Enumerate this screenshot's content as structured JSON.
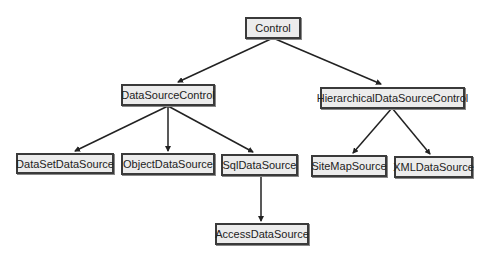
{
  "diagram": {
    "type": "class-hierarchy",
    "nodes": {
      "control": "Control",
      "datasourcecontrol": "DataSourceControl",
      "hierarchical": "HierarchicalDataSourceControl",
      "datasetdatasource": "DataSetDataSource",
      "objectdatasource": "ObjectDataSource",
      "sqldatasource": "SqlDataSource",
      "sitemapsource": "SiteMapSource",
      "xmldatasource": "XMLDataSource",
      "accessdatasource": "AccessDataSource"
    },
    "edges": [
      [
        "Control",
        "DataSourceControl"
      ],
      [
        "Control",
        "HierarchicalDataSourceControl"
      ],
      [
        "DataSourceControl",
        "DataSetDataSource"
      ],
      [
        "DataSourceControl",
        "ObjectDataSource"
      ],
      [
        "DataSourceControl",
        "SqlDataSource"
      ],
      [
        "HierarchicalDataSourceControl",
        "SiteMapSource"
      ],
      [
        "HierarchicalDataSourceControl",
        "XMLDataSource"
      ],
      [
        "SqlDataSource",
        "AccessDataSource"
      ]
    ],
    "colors": {
      "box_fill": "#ececec",
      "box_border": "#3a3a3a",
      "line": "#222222"
    }
  }
}
